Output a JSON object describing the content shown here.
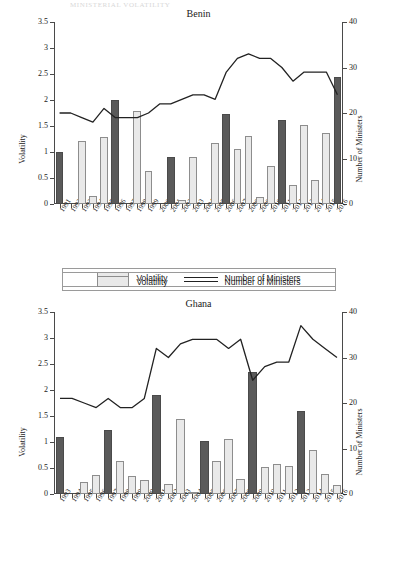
{
  "ghost_header": "MINISTERIAL VOLATILITY",
  "legend": {
    "volatility_label": "Volatility",
    "ministers_label": "Number of Ministers"
  },
  "axes": {
    "left_title": "Volatility",
    "right_title": "Number of Ministers",
    "left_ticks": [
      "0",
      "0.5",
      "1",
      "1.5",
      "2",
      "2.5",
      "3",
      "3.5"
    ],
    "right_ticks": [
      "0",
      "10",
      "20",
      "30",
      "40"
    ],
    "left_range": [
      0,
      3.5
    ],
    "right_range": [
      0,
      40
    ]
  },
  "colors": {
    "bar_light": "#e9e9e9",
    "bar_dark": "#5a5a5a",
    "bar_border": "#8d8d8d",
    "line": "#222222",
    "axis": "#4a4a4a"
  },
  "chart_data": [
    {
      "type": "bar",
      "title": "Benin",
      "xlabel": "",
      "ylabel": "Volatility",
      "y2label": "Number of Ministers",
      "ylim": [
        0,
        3.5
      ],
      "y2lim": [
        0,
        40
      ],
      "grid": false,
      "legend_position": "bottom",
      "categories": [
        "1991",
        "1992",
        "1993",
        "1994",
        "1995",
        "1996",
        "1997",
        "1998",
        "1999",
        "2000",
        "2001",
        "2002",
        "2003",
        "2004",
        "2005",
        "2006",
        "2007",
        "2008",
        "2009",
        "2010",
        "2011",
        "2012",
        "2013",
        "2014",
        "2015",
        "2016"
      ],
      "series": [
        {
          "name": "Volatility",
          "axis": "left",
          "values": [
            1.0,
            null,
            1.21,
            0.16,
            1.29,
            2.0,
            null,
            1.78,
            0.64,
            null,
            0.9,
            0.08,
            0.91,
            null,
            1.17,
            1.74,
            1.05,
            1.3,
            0.14,
            0.74,
            1.61,
            0.36,
            1.51,
            0.47,
            1.37,
            2.44
          ],
          "highlight_years": [
            "1991",
            "1996",
            "2001",
            "2006",
            "2011",
            "2016"
          ],
          "highlight_note": "election years drawn in dark fill"
        },
        {
          "name": "Number of Ministers",
          "axis": "right",
          "values": [
            20,
            20,
            19,
            18,
            21,
            19,
            19,
            19,
            20,
            22,
            22,
            23,
            24,
            24,
            23,
            29,
            32,
            33,
            32,
            32,
            30,
            27,
            29,
            29,
            29,
            24
          ]
        }
      ]
    },
    {
      "type": "bar",
      "title": "Ghana",
      "xlabel": "",
      "ylabel": "Volatility",
      "y2label": "Number of Ministers",
      "ylim": [
        0,
        3.5
      ],
      "y2lim": [
        0,
        40
      ],
      "grid": false,
      "legend_position": "bottom",
      "categories": [
        "1993",
        "1994",
        "1995",
        "1996",
        "1997",
        "1998",
        "1999",
        "2000",
        "2001",
        "2002",
        "2003",
        "2004",
        "2005",
        "2006",
        "2007",
        "2008",
        "2009",
        "2010",
        "2011",
        "2012",
        "2013",
        "2014",
        "2015",
        "2016"
      ],
      "series": [
        {
          "name": "Volatility",
          "axis": "left",
          "values": [
            1.09,
            null,
            0.24,
            0.36,
            1.24,
            0.63,
            0.34,
            0.27,
            1.9,
            0.19,
            1.44,
            0.01,
            1.02,
            0.63,
            1.05,
            0.28,
            2.35,
            0.52,
            0.57,
            0.53,
            1.6,
            0.84,
            0.39,
            0.18
          ],
          "highlight_years": [
            "1993",
            "1997",
            "2001",
            "2005",
            "2009",
            "2013"
          ],
          "highlight_note": "election years drawn in dark fill"
        },
        {
          "name": "Number of Ministers",
          "axis": "right",
          "values": [
            21,
            21,
            20,
            19,
            21,
            19,
            19,
            21,
            32,
            30,
            33,
            34,
            34,
            34,
            32,
            34,
            25,
            28,
            29,
            29,
            37,
            34,
            32,
            30
          ]
        }
      ]
    }
  ]
}
